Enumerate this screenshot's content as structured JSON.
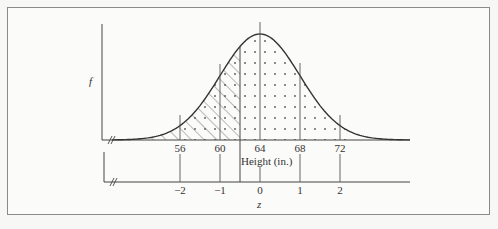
{
  "chart_data": {
    "type": "area",
    "title": "",
    "ylabel": "f",
    "xlabel": "Height (in.)",
    "x2label": "z",
    "mean": 64,
    "sd": 4,
    "height_ticks": [
      56,
      60,
      64,
      68,
      72
    ],
    "z_ticks": [
      -2,
      -1,
      0,
      1,
      2
    ],
    "shaded_regions": [
      {
        "name": "hatched",
        "pattern": "diagonal-lines",
        "from_height": 54,
        "to_height": 62,
        "to_z": -0.5
      },
      {
        "name": "dotted",
        "pattern": "dots",
        "from_height": 56,
        "to_height": 73
      }
    ],
    "boundary_line": {
      "height": 62,
      "z": -0.5
    },
    "axis_break_marks": [
      "upper-axis",
      "lower-axis"
    ],
    "grid": false,
    "legend": null
  },
  "labels": {
    "y_axis": "f",
    "x_axis": "Height (in.)",
    "z_axis": "z",
    "height_ticks": [
      "56",
      "60",
      "64",
      "68",
      "72"
    ],
    "z_ticks": [
      "−2",
      "−1",
      "0",
      "1",
      "2"
    ]
  }
}
